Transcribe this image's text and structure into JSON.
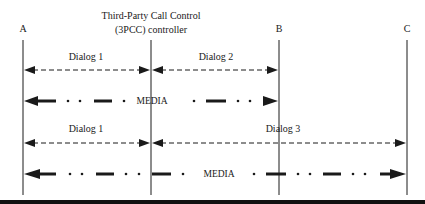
{
  "diagram": {
    "title_line1": "Third-Party Call Control",
    "title_line2": "(3PCC) controller",
    "participants": [
      {
        "id": "A",
        "label": "A",
        "x": 23
      },
      {
        "id": "controller",
        "label": "",
        "x": 151
      },
      {
        "id": "B",
        "label": "B",
        "x": 279
      },
      {
        "id": "C",
        "label": "C",
        "x": 407
      }
    ],
    "before": {
      "dialog1": "Dialog 1",
      "dialog2": "Dialog 2",
      "media": "MEDIA"
    },
    "after": {
      "dialog1": "Dialog 1",
      "dialog3": "Dialog 3",
      "media": "MEDIA"
    },
    "colors": {
      "line": "#1a1a1a",
      "background": "#ffffff"
    }
  }
}
